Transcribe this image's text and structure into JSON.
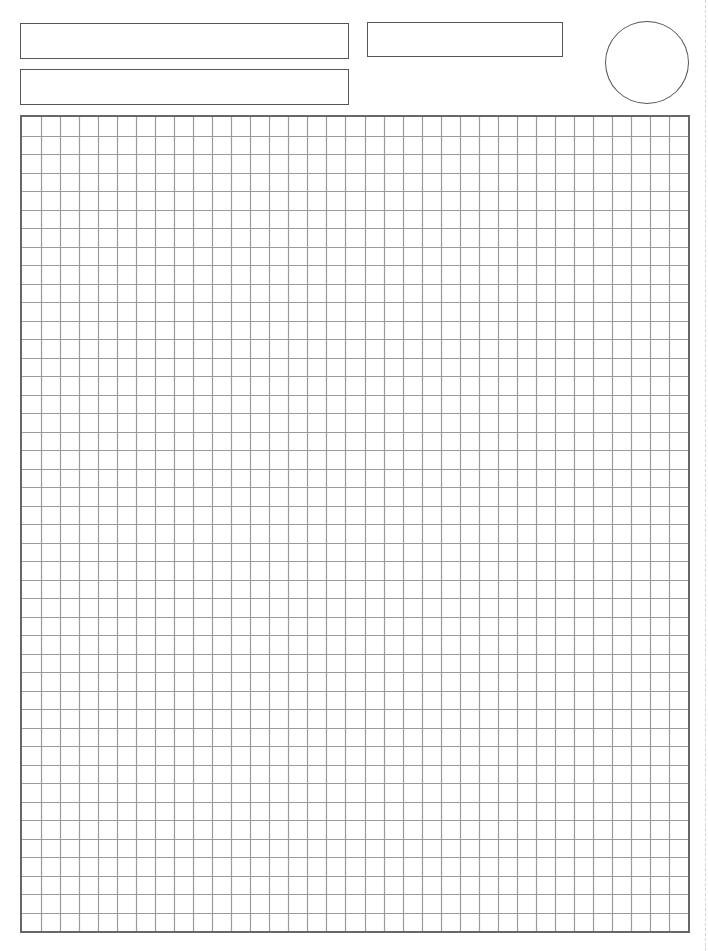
{
  "page": {
    "type": "graph paper worksheet",
    "background": "#ffffff"
  },
  "header": {
    "fields": [
      {
        "id": "name-field",
        "label": "",
        "value": ""
      },
      {
        "id": "class-field",
        "label": "",
        "value": ""
      },
      {
        "id": "date-field",
        "label": "",
        "value": ""
      }
    ],
    "score_circle": {
      "value": ""
    }
  },
  "grid": {
    "columns": 35,
    "rows": 44,
    "line_color": "#9a9a9a",
    "border_color": "#666666"
  },
  "colors": {
    "box_border": "#555555",
    "cut_line": "#d4d4d4"
  }
}
